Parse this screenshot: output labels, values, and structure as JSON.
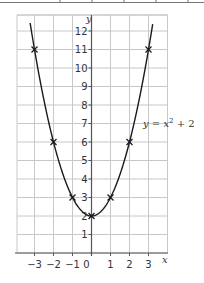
{
  "chart_data": {
    "type": "line",
    "title": "",
    "xlabel": "x",
    "ylabel": "y",
    "xlim": [
      -4,
      4
    ],
    "ylim": [
      0,
      13
    ],
    "grid": true,
    "x_ticks": [
      -3,
      -2,
      -1,
      0,
      1,
      2,
      3
    ],
    "x_tick_labels": [
      "−3",
      "−2",
      "−1",
      "0",
      "1",
      "2",
      "3"
    ],
    "y_ticks": [
      1,
      2,
      3,
      4,
      5,
      6,
      7,
      8,
      9,
      10,
      11,
      12
    ],
    "y_tick_labels": [
      "1",
      "2",
      "3",
      "4",
      "5",
      "6",
      "7",
      "8",
      "9",
      "10",
      "11",
      "12"
    ],
    "series": [
      {
        "name": "y = x² + 2",
        "equation": "y = x^2 + 2",
        "curve": "parabola",
        "points": [
          {
            "x": -3,
            "y": 11
          },
          {
            "x": -2,
            "y": 6
          },
          {
            "x": -1,
            "y": 3
          },
          {
            "x": 0,
            "y": 2
          },
          {
            "x": 1,
            "y": 3
          },
          {
            "x": 2,
            "y": 6
          },
          {
            "x": 3,
            "y": 11
          }
        ],
        "marker": "x",
        "color": "#1a1a1a"
      }
    ],
    "annotations": [
      {
        "text": "y = x² + 2",
        "x": 2.7,
        "y": 7
      }
    ]
  },
  "labels": {
    "x_axis": "x",
    "y_axis": "y",
    "equation_y": "y",
    "equation_eq": " = ",
    "equation_x": "x",
    "equation_exp": "2",
    "equation_rest": " + 2"
  },
  "colors": {
    "grid": "#c8c8c8",
    "axis": "#555555",
    "curve": "#1a1a1a",
    "text": "#333333"
  }
}
